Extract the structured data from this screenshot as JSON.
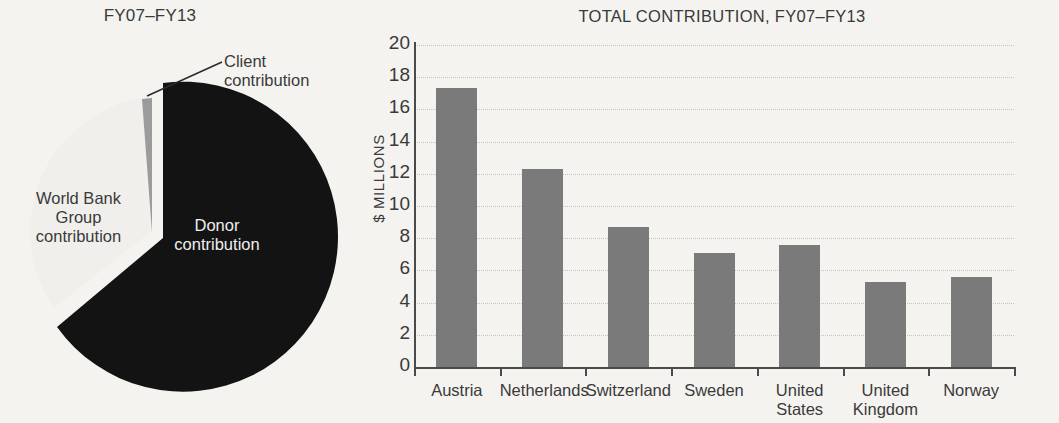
{
  "pie_panel": {
    "title": "FY07–FY13",
    "labels": {
      "client": "Client\ncontribution",
      "client_line1": "Client",
      "client_line2": "contribution",
      "wbg_line1": "World Bank",
      "wbg_line2": "Group",
      "wbg_line3": "contribution",
      "donor_line1": "Donor",
      "donor_line2": "contribution"
    }
  },
  "bar_panel": {
    "title": "TOTAL CONTRIBUTION, FY07–FY13",
    "ylabel": "$ MILLIONS"
  },
  "colors": {
    "background": "#f4f3f0",
    "bar_gray": "#7a7a7a",
    "donor_black": "#111111",
    "client_gray": "#9b9b9b",
    "wbg_white": "#f4f3f0",
    "axis": "#4a4a4a",
    "grid": "#c6c4c0",
    "text": "#3a3a3a"
  },
  "chart_data": [
    {
      "type": "pie",
      "title": "FY07–FY13",
      "labels": [
        "Donor contribution",
        "World Bank Group contribution",
        "Client contribution"
      ],
      "values": [
        69,
        29.5,
        1.5
      ],
      "colors": [
        "#111111",
        "#f4f3f0",
        "#9b9b9b"
      ],
      "exploded": [
        "Donor contribution"
      ],
      "legend": "labels-on-slices",
      "start_angle_deg": 0,
      "direction": "clockwise"
    },
    {
      "type": "bar",
      "title": "TOTAL CONTRIBUTION, FY07–FY13",
      "xlabel": "",
      "ylabel": "$ MILLIONS",
      "ylim": [
        0,
        20
      ],
      "yticks": [
        0,
        2,
        4,
        6,
        8,
        10,
        12,
        14,
        16,
        18,
        20
      ],
      "grid": true,
      "legend": "none",
      "categories": [
        "Austria",
        "Netherlands",
        "Switzerland",
        "Sweden",
        "United States",
        "United Kingdom",
        "Norway"
      ],
      "category_lines": [
        [
          "Austria"
        ],
        [
          "Netherlands"
        ],
        [
          "Switzerland"
        ],
        [
          "Sweden"
        ],
        [
          "United",
          "States"
        ],
        [
          "United",
          "Kingdom"
        ],
        [
          "Norway"
        ]
      ],
      "values": [
        17.3,
        12.3,
        8.7,
        7.1,
        7.6,
        5.3,
        5.6
      ],
      "bar_color": "#7a7a7a"
    }
  ]
}
